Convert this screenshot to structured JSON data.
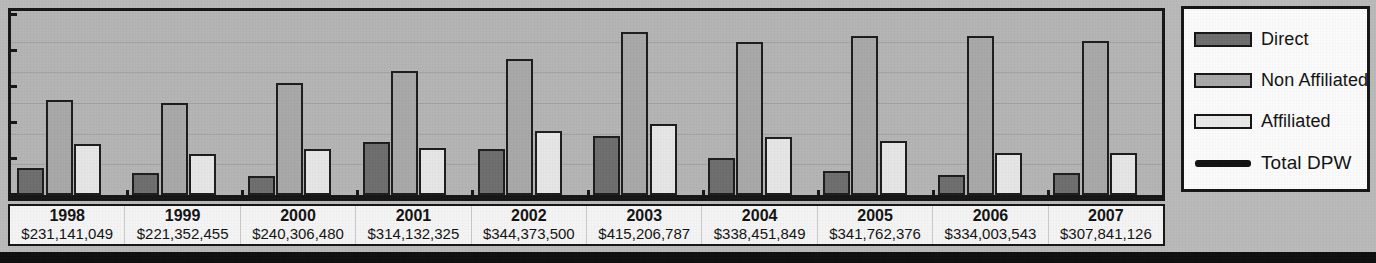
{
  "chart_data": {
    "type": "bar",
    "title": "",
    "subtitle": "",
    "xlabel": "",
    "ylabel": "",
    "grid": true,
    "legend_position": "right",
    "ylim": [
      0,
      250000000
    ],
    "categories": [
      "1998",
      "1999",
      "2000",
      "2001",
      "2002",
      "2003",
      "2004",
      "2005",
      "2006",
      "2007"
    ],
    "totals": [
      "$231,141,049",
      "$221,352,455",
      "$240,306,480",
      "$314,132,325",
      "$344,373,500",
      "$415,206,787",
      "$338,451,849",
      "$341,762,376",
      "$334,003,543",
      "$307,841,126"
    ],
    "totals_numeric": [
      231141049,
      221352455,
      240306480,
      314132325,
      344373500,
      415206787,
      338451849,
      341762376,
      334003543,
      307841126
    ],
    "series": [
      {
        "name": "Direct",
        "kind": "bar",
        "color": "#6d6d6d",
        "values": [
          16,
          13,
          11,
          31,
          27,
          35,
          22,
          14,
          12,
          13
        ]
      },
      {
        "name": "Non Affiliated",
        "kind": "bar",
        "color": "#a8a8a8",
        "values": [
          56,
          54,
          66,
          73,
          80,
          96,
          90,
          94,
          94,
          91
        ]
      },
      {
        "name": "Affiliated",
        "kind": "bar",
        "color": "#e6e6e6",
        "values": [
          30,
          24,
          27,
          28,
          38,
          42,
          34,
          32,
          25,
          25
        ]
      },
      {
        "name": "Total DPW",
        "kind": "line",
        "color": "#111111",
        "values": [
          115,
          113,
          120,
          145,
          155,
          185,
          163,
          165,
          161,
          150
        ]
      }
    ],
    "y_ticks": [
      0,
      1,
      2,
      3,
      4,
      5
    ],
    "x_tick_marks": 10
  },
  "legend": {
    "items": [
      {
        "label": "Direct",
        "swatch": "bar-swatch-direct"
      },
      {
        "label": "Non Affiliated",
        "swatch": "bar-swatch-nonaffiliated"
      },
      {
        "label": "Affiliated",
        "swatch": "bar-swatch-affiliated"
      },
      {
        "label": "Total DPW",
        "swatch": "line-swatch-total-dpw"
      }
    ]
  },
  "colors": {
    "direct": "#6d6d6d",
    "non_affiliated": "#a8a8a8",
    "affiliated": "#e6e6e6",
    "total_line": "#111111",
    "plot_background": "#b4b4b4",
    "frame": "#141414",
    "page_background": "#b9b9b9"
  }
}
